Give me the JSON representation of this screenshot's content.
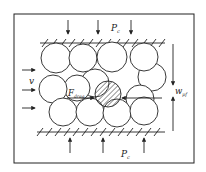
{
  "diagram": {
    "title": "",
    "colors": {
      "stroke": "#222222",
      "background": "#ffffff",
      "hatch": "#333333"
    },
    "labels": {
      "pressure_top": "P",
      "pressure_top_sub": "c",
      "pressure_bottom": "P",
      "pressure_bottom_sub": "c",
      "velocity": "v",
      "drag_force": "F",
      "drag_force_sub": "drag",
      "width": "w",
      "width_sub": "pf"
    },
    "components": [
      "outer-frame",
      "top-wall-hatched",
      "bottom-wall-hatched",
      "particle-circles",
      "hatched-particle",
      "flow-arrows",
      "pressure-arrows",
      "drag-force-arrow",
      "width-dimension-arrow"
    ]
  }
}
